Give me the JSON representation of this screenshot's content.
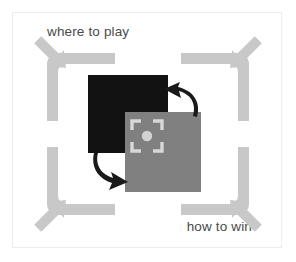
{
  "canvas": {
    "width": 296,
    "height": 262,
    "background_color": "#ffffff",
    "border_color": "#ececec"
  },
  "captions": {
    "top_left": "where to play",
    "bottom_right": "how to win",
    "text_color": "#4a4a4a"
  },
  "diagram": {
    "frame": {
      "name": "corner-bracket-frame",
      "color": "#c8c8c8",
      "arm_thickness": 11,
      "corners": [
        "top-left",
        "top-right",
        "bottom-left",
        "bottom-right"
      ]
    },
    "expansion_arrows": {
      "name": "outward-diagonal-arrows",
      "color": "#c8c8c8",
      "count": 4,
      "directions": [
        "up-left",
        "up-right",
        "down-left",
        "down-right"
      ]
    },
    "squares": [
      {
        "id": "dark-square",
        "label": "where to play",
        "color": "#121212"
      },
      {
        "id": "gray-square",
        "label": "how to win",
        "color": "#808080"
      }
    ],
    "focus_icon": {
      "name": "focus-target-icon",
      "color": "#d8d8d8",
      "center_dot_color": "#d0d0d0"
    },
    "cycle_arrows": {
      "name": "curved-cycle-arrows",
      "color": "#1a1a1a",
      "count": 2,
      "directions": [
        "up-left",
        "down-right"
      ]
    }
  }
}
